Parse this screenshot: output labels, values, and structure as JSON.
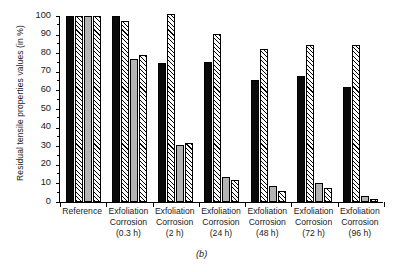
{
  "chart_data": {
    "type": "bar",
    "title": "",
    "panel_label": "(b)",
    "xlabel": "",
    "ylabel": "Residual tensile properties values (in %)",
    "ylim": [
      0,
      100
    ],
    "ytick_step": 10,
    "yminor_step": 5,
    "grid": false,
    "legend": null,
    "categories": [
      "Reference",
      "Exfoliation Corrosion (0.3 h)",
      "Exfoliation Corrosion (2 h)",
      "Exfoliation Corrosion (24 h)",
      "Exfoliation Corrosion (48 h)",
      "Exfoliation Corrosion (72 h)",
      "Exfoliation Corrosion (96 h)"
    ],
    "category_lines": [
      [
        "Reference",
        "",
        ""
      ],
      [
        "Exfoliation",
        "Corrosion",
        "(0.3 h)"
      ],
      [
        "Exfoliation",
        "Corrosion",
        "(2 h)"
      ],
      [
        "Exfoliation",
        "Corrosion",
        "(24 h)"
      ],
      [
        "Exfoliation",
        "Corrosion",
        "(48 h)"
      ],
      [
        "Exfoliation",
        "Corrosion",
        "(72 h)"
      ],
      [
        "Exfoliation",
        "Corrosion",
        "(96 h)"
      ]
    ],
    "ytick_labels": [
      "0",
      "10",
      "20",
      "30",
      "40",
      "50",
      "60",
      "70",
      "80",
      "90",
      "100"
    ],
    "series": [
      {
        "name": "series-1",
        "style": "solid-black",
        "values": [
          100,
          100,
          74.5,
          75.5,
          65.5,
          68.0,
          62.0
        ]
      },
      {
        "name": "series-2",
        "style": "hatched",
        "values": [
          100,
          97.5,
          101.0,
          90.5,
          82.0,
          84.5,
          84.5
        ]
      },
      {
        "name": "series-3",
        "style": "solid-gray",
        "values": [
          100,
          77.0,
          30.5,
          13.5,
          8.5,
          10.0,
          3.0
        ]
      },
      {
        "name": "series-4",
        "style": "hatched",
        "values": [
          100,
          79.0,
          31.5,
          12.0,
          6.0,
          7.5,
          1.5
        ]
      }
    ],
    "colors": {
      "solid_black": "#0a0a0a",
      "solid_gray": "#b4b4b4",
      "hatch_fill": "#fdfdfd",
      "hatch_line": "#000000",
      "axis": "#000000"
    }
  }
}
